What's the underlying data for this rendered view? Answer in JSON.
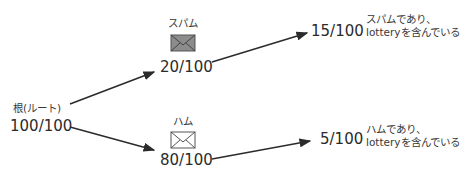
{
  "diagram": {
    "root": {
      "label": "根(ルート)",
      "value": "100/100"
    },
    "spam": {
      "label": "スパム",
      "value": "20/100",
      "icon": "envelope-filled-icon"
    },
    "ham": {
      "label": "ハム",
      "value": "80/100",
      "icon": "envelope-outline-icon"
    },
    "spam_lottery": {
      "value": "15/100",
      "desc_line1": "スパムであり、",
      "desc_line2": "lotteryを含んでいる"
    },
    "ham_lottery": {
      "value": "5/100",
      "desc_line1": "ハムであり、",
      "desc_line2": "lotteryを含んでいる"
    },
    "colors": {
      "line": "#2b2b2b",
      "spam_envelope_fill": "#8c8c8c",
      "ham_envelope_fill": "#ffffff"
    }
  }
}
